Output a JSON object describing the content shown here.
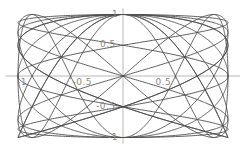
{
  "figure": {
    "background_color": "#ffffff",
    "curve_color": "#4d4d4d",
    "axis_color": "#b0b0b0",
    "label_color": "#8a8a8a",
    "curve_stroke_width": 0.9,
    "axis_stroke_width": 0.9
  },
  "chart_data": {
    "type": "line",
    "title": "",
    "xlabel": "",
    "ylabel": "",
    "xlim": [
      -1.12,
      1.12
    ],
    "ylim": [
      -1.1,
      1.1
    ],
    "grid": false,
    "legend": "none",
    "axes": {
      "x_axis_y_value": 0,
      "y_axis_x_value": 0,
      "x_ticks": [
        -1,
        -0.5,
        0.5
      ],
      "x_tick_labels": [
        "-1",
        "-0.5",
        "0.5"
      ],
      "y_ticks": [
        1,
        0.5,
        -0.5,
        -1
      ],
      "y_tick_labels": [
        "1",
        "0.5",
        "-0.5",
        "-1"
      ]
    },
    "series": [
      {
        "name": "lissajous-1-1",
        "a": 1,
        "b": 1,
        "phase": 1.5707963,
        "samples": 720
      },
      {
        "name": "lissajous-1-2",
        "a": 1,
        "b": 2,
        "phase": 1.5707963,
        "samples": 720
      },
      {
        "name": "lissajous-2-1",
        "a": 2,
        "b": 1,
        "phase": 1.5707963,
        "samples": 720
      },
      {
        "name": "lissajous-1-3",
        "a": 1,
        "b": 3,
        "phase": 1.5707963,
        "samples": 720
      },
      {
        "name": "lissajous-3-1",
        "a": 3,
        "b": 1,
        "phase": 1.5707963,
        "samples": 720
      },
      {
        "name": "lissajous-2-3",
        "a": 2,
        "b": 3,
        "phase": 1.5707963,
        "samples": 720
      },
      {
        "name": "lissajous-3-2",
        "a": 3,
        "b": 2,
        "phase": 1.5707963,
        "samples": 720
      }
    ]
  },
  "geometry": {
    "origin_px_x": 123,
    "origin_px_y": 76,
    "unit_px_x": 105,
    "unit_px_y": 61.5,
    "tick_len_px": 3
  },
  "labels": {
    "y_top": "1",
    "y_half": "0.5",
    "y_neg_half": "-0.5",
    "y_bottom": "-1",
    "x_neg_one": "-1",
    "x_neg_half": "-0.5",
    "x_half": "0.5"
  }
}
